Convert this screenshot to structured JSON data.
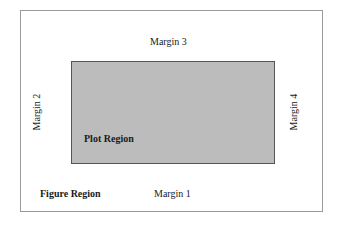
{
  "diagram": {
    "figure_region": {
      "label": "Figure Region",
      "border_color": "#9a9a9a",
      "fill_color": "#ffffff"
    },
    "plot_region": {
      "label": "Plot Region",
      "fill_color": "#bcbcbc",
      "border_color": "#555555"
    },
    "margins": {
      "bottom": "Margin 1",
      "left": "Margin 2",
      "top": "Margin 3",
      "right": "Margin 4"
    }
  }
}
